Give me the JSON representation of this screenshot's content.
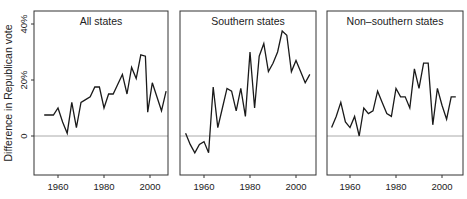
{
  "figure": {
    "ylabel": "Difference in Republican vote",
    "yticks": [
      {
        "value": 0,
        "label": "0"
      },
      {
        "value": 20,
        "label": "20%"
      },
      {
        "value": 40,
        "label": "40%"
      }
    ],
    "xticks": [
      {
        "value": 1960,
        "label": "1960"
      },
      {
        "value": 1980,
        "label": "1980"
      },
      {
        "value": 2000,
        "label": "2000"
      }
    ],
    "colors": {
      "line": "#1a1a1a",
      "frame": "#333333",
      "zero_line": "#aaaaaa",
      "text": "#222222"
    }
  },
  "chart_data": [
    {
      "type": "line",
      "title": "All states",
      "xlabel": "",
      "ylabel": "Difference in Republican vote",
      "xlim": [
        1950,
        2008
      ],
      "ylim": [
        -14,
        45
      ],
      "grid": false,
      "reference_line": 0,
      "x": [
        1954,
        1956,
        1958,
        1960,
        1962,
        1964,
        1966,
        1968,
        1970,
        1972,
        1974,
        1976,
        1978,
        1980,
        1982,
        1984,
        1986,
        1988,
        1990,
        1992,
        1994,
        1996,
        1998,
        1999,
        2001,
        2003,
        2005,
        2007
      ],
      "values": [
        7.5,
        7.5,
        7.5,
        10,
        5,
        1,
        12,
        3,
        12,
        13,
        14,
        17.5,
        17.5,
        10,
        15,
        15,
        18.5,
        22,
        15,
        24.5,
        20.5,
        29,
        28.5,
        8.5,
        19,
        14,
        9,
        16
      ]
    },
    {
      "type": "line",
      "title": "Southern states",
      "xlabel": "",
      "ylabel": "Difference in Republican vote",
      "xlim": [
        1950,
        2008
      ],
      "ylim": [
        -14,
        45
      ],
      "grid": false,
      "reference_line": 0,
      "x": [
        1952,
        1954,
        1956,
        1958,
        1960,
        1962,
        1964,
        1966,
        1968,
        1970,
        1972,
        1974,
        1976,
        1978,
        1980,
        1982,
        1984,
        1986,
        1988,
        1990,
        1992,
        1994,
        1996,
        1998,
        2000,
        2002,
        2004,
        2006
      ],
      "values": [
        1,
        -3,
        -6,
        -3,
        -2,
        -6,
        17.5,
        3,
        10,
        17,
        16,
        9,
        17,
        7,
        30,
        10,
        28.5,
        33,
        23,
        26,
        30,
        37.5,
        36,
        23,
        27,
        23,
        19,
        22
      ]
    },
    {
      "type": "line",
      "title": "Non–southern states",
      "xlabel": "",
      "ylabel": "Difference in Republican vote",
      "xlim": [
        1950,
        2008
      ],
      "ylim": [
        -14,
        45
      ],
      "grid": false,
      "reference_line": 0,
      "x": [
        1952,
        1954,
        1956,
        1958,
        1960,
        1962,
        1964,
        1966,
        1968,
        1970,
        1972,
        1974,
        1976,
        1978,
        1980,
        1982,
        1984,
        1986,
        1988,
        1990,
        1992,
        1994,
        1996,
        1998,
        2000,
        2002,
        2004,
        2006
      ],
      "values": [
        3,
        7,
        12,
        5,
        3,
        7,
        0,
        10,
        8,
        9,
        16,
        12,
        8,
        7,
        17,
        14,
        14,
        10,
        24,
        17,
        26,
        26,
        4,
        17,
        11,
        6,
        14,
        14
      ]
    }
  ],
  "header": {
    "clipped_text": ""
  }
}
